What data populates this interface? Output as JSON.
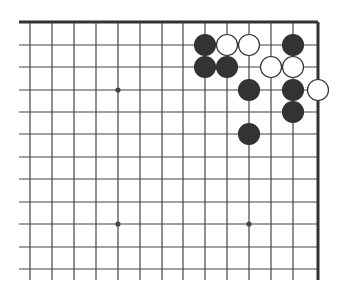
{
  "diagram": {
    "board": {
      "x_lines": [
        30,
        52,
        74,
        96,
        118,
        140,
        162,
        183,
        205,
        227,
        249,
        271,
        293,
        318
      ],
      "y_lines": [
        22,
        45,
        67,
        90,
        112,
        134,
        157,
        179,
        202,
        224,
        247,
        269
      ],
      "left_extent": 19,
      "bottom_extent": 280,
      "top_border_y": 22,
      "right_border_x": 318,
      "line_color": "#444444",
      "border_color": "#333333"
    },
    "star_points": [
      {
        "x": 118,
        "y": 90
      },
      {
        "x": 118,
        "y": 224
      },
      {
        "x": 249,
        "y": 224
      }
    ],
    "stones": [
      {
        "color": "black",
        "x": 205,
        "y": 45
      },
      {
        "color": "white",
        "x": 227,
        "y": 45
      },
      {
        "color": "white",
        "x": 249,
        "y": 45
      },
      {
        "color": "black",
        "x": 293,
        "y": 45
      },
      {
        "color": "black",
        "x": 205,
        "y": 67
      },
      {
        "color": "black",
        "x": 227,
        "y": 67
      },
      {
        "color": "white",
        "x": 271,
        "y": 67
      },
      {
        "color": "white",
        "x": 293,
        "y": 67
      },
      {
        "color": "black",
        "x": 249,
        "y": 90
      },
      {
        "color": "black",
        "x": 293,
        "y": 90
      },
      {
        "color": "white",
        "x": 318,
        "y": 90
      },
      {
        "color": "black",
        "x": 293,
        "y": 112
      },
      {
        "color": "black",
        "x": 249,
        "y": 134
      }
    ],
    "colors": {
      "black_stone": "#333333",
      "white_stone": "#ffffff",
      "stone_outline": "#333333"
    }
  }
}
